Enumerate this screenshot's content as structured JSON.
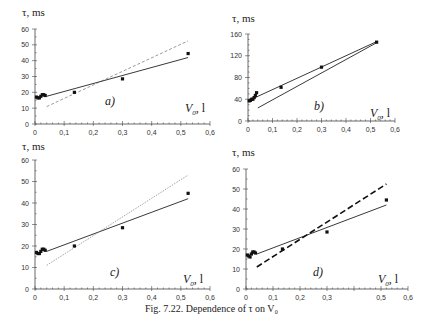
{
  "caption": "Fig. 7.22. Dependence of τ on V₀",
  "chart_data": [
    {
      "id": "a",
      "type": "scatter",
      "panel_label": "a)",
      "ylabel": "τ, ms",
      "xlabel": "V₀, l",
      "xlim": [
        0,
        0.6
      ],
      "ylim": [
        0,
        60
      ],
      "xticks": [
        "0",
        "0,1",
        "0,2",
        "0,3",
        "0,4",
        "0,5",
        "0,6"
      ],
      "yticks": [
        "0",
        "10",
        "20",
        "30",
        "40",
        "50",
        "60"
      ],
      "points": [
        [
          0.005,
          17
        ],
        [
          0.01,
          16.5
        ],
        [
          0.015,
          16.5
        ],
        [
          0.02,
          17.5
        ],
        [
          0.025,
          18.5
        ],
        [
          0.03,
          18.5
        ],
        [
          0.035,
          18
        ],
        [
          0.135,
          20
        ],
        [
          0.3,
          28.5
        ],
        [
          0.525,
          44.5
        ]
      ],
      "series": [
        {
          "name": "solid fit",
          "style": "solid",
          "x": [
            0.04,
            0.525
          ],
          "y": [
            17.5,
            42
          ]
        },
        {
          "name": "dashed fit",
          "style": "dashed",
          "x": [
            0.04,
            0.525
          ],
          "y": [
            11,
            52.5
          ]
        }
      ]
    },
    {
      "id": "b",
      "type": "scatter",
      "panel_label": "b)",
      "ylabel": "τ, ms",
      "xlabel": "V₀, l",
      "xlim": [
        0,
        0.6
      ],
      "ylim": [
        0,
        160
      ],
      "xticks": [
        "0",
        "0,1",
        "0,2",
        "0,3",
        "0,4",
        "0,5",
        "0,6"
      ],
      "yticks": [
        "0",
        "40",
        "80",
        "120",
        "160"
      ],
      "points": [
        [
          0.005,
          37
        ],
        [
          0.01,
          38
        ],
        [
          0.015,
          40
        ],
        [
          0.02,
          40
        ],
        [
          0.025,
          43
        ],
        [
          0.03,
          47
        ],
        [
          0.035,
          52
        ],
        [
          0.135,
          62
        ],
        [
          0.3,
          99
        ],
        [
          0.525,
          145
        ]
      ],
      "series": [
        {
          "name": "fit 1",
          "style": "solid",
          "x": [
            0.0,
            0.525
          ],
          "y": [
            37,
            146
          ]
        },
        {
          "name": "fit 2",
          "style": "solid",
          "x": [
            0.04,
            0.525
          ],
          "y": [
            24,
            144
          ]
        }
      ]
    },
    {
      "id": "c",
      "type": "scatter",
      "panel_label": "c)",
      "ylabel": "τ, ms",
      "xlabel": "V₀, l",
      "xlim": [
        0,
        0.6
      ],
      "ylim": [
        0,
        60
      ],
      "xticks": [
        "0",
        "0,1",
        "0,2",
        "0,3",
        "0,4",
        "0,5",
        "0,6"
      ],
      "yticks": [
        "0",
        "10",
        "20",
        "30",
        "40",
        "50",
        "60"
      ],
      "points": [
        [
          0.005,
          17
        ],
        [
          0.01,
          16.5
        ],
        [
          0.015,
          16.5
        ],
        [
          0.02,
          17.5
        ],
        [
          0.025,
          18.5
        ],
        [
          0.03,
          18.5
        ],
        [
          0.035,
          18
        ],
        [
          0.135,
          20
        ],
        [
          0.3,
          28.5
        ],
        [
          0.525,
          44.5
        ]
      ],
      "series": [
        {
          "name": "solid fit",
          "style": "solid",
          "x": [
            0.04,
            0.525
          ],
          "y": [
            17.5,
            42
          ]
        },
        {
          "name": "dotted fit",
          "style": "dotted",
          "x": [
            0.04,
            0.525
          ],
          "y": [
            11,
            53
          ]
        }
      ]
    },
    {
      "id": "d",
      "type": "scatter",
      "panel_label": "d)",
      "ylabel": "τ, ms",
      "xlabel": "V₀, l",
      "xlim": [
        0,
        0.6
      ],
      "ylim": [
        0,
        60
      ],
      "xticks": [
        "0",
        "0,1",
        "0,2",
        "0,3",
        "0,5",
        "0,6"
      ],
      "yticks": [
        "0",
        "10",
        "20",
        "30",
        "40",
        "50",
        "60"
      ],
      "points": [
        [
          0.005,
          17
        ],
        [
          0.01,
          16.5
        ],
        [
          0.015,
          16
        ],
        [
          0.02,
          17.5
        ],
        [
          0.025,
          18.5
        ],
        [
          0.03,
          18.5
        ],
        [
          0.035,
          18
        ],
        [
          0.135,
          20
        ],
        [
          0.3,
          28.5
        ],
        [
          0.52,
          44.5
        ]
      ],
      "series": [
        {
          "name": "solid fit",
          "style": "solid",
          "x": [
            0.04,
            0.52
          ],
          "y": [
            17.5,
            42
          ]
        },
        {
          "name": "heavy dashed fit",
          "style": "bold-dashed",
          "x": [
            0.04,
            0.52
          ],
          "y": [
            11,
            52.5
          ]
        }
      ]
    }
  ]
}
